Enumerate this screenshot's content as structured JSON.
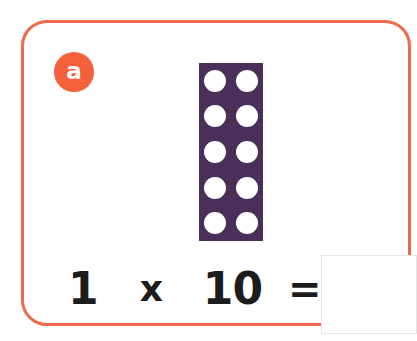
{
  "card": {
    "border_color": "#ee6a4d",
    "background": "#ffffff"
  },
  "badge": {
    "label": "a",
    "color": "#f4603c",
    "text_color": "#ffffff",
    "name": "question-label-a"
  },
  "manipulative": {
    "type": "ten-block",
    "block_color": "#4a3058",
    "dot_color": "#ffffff",
    "rows": 5,
    "columns": 2,
    "dot_count": 10,
    "dots": [
      "dot-1",
      "dot-2",
      "dot-3",
      "dot-4",
      "dot-5",
      "dot-6",
      "dot-7",
      "dot-8",
      "dot-9",
      "dot-10"
    ]
  },
  "equation": {
    "factor_1": "1",
    "operator_multiply": "x",
    "factor_2": "10",
    "operator_equals": "=",
    "text_color": "#1c1c1c"
  },
  "answer": {
    "value": "",
    "placeholder": "",
    "border_color": "#e6e6e6"
  }
}
